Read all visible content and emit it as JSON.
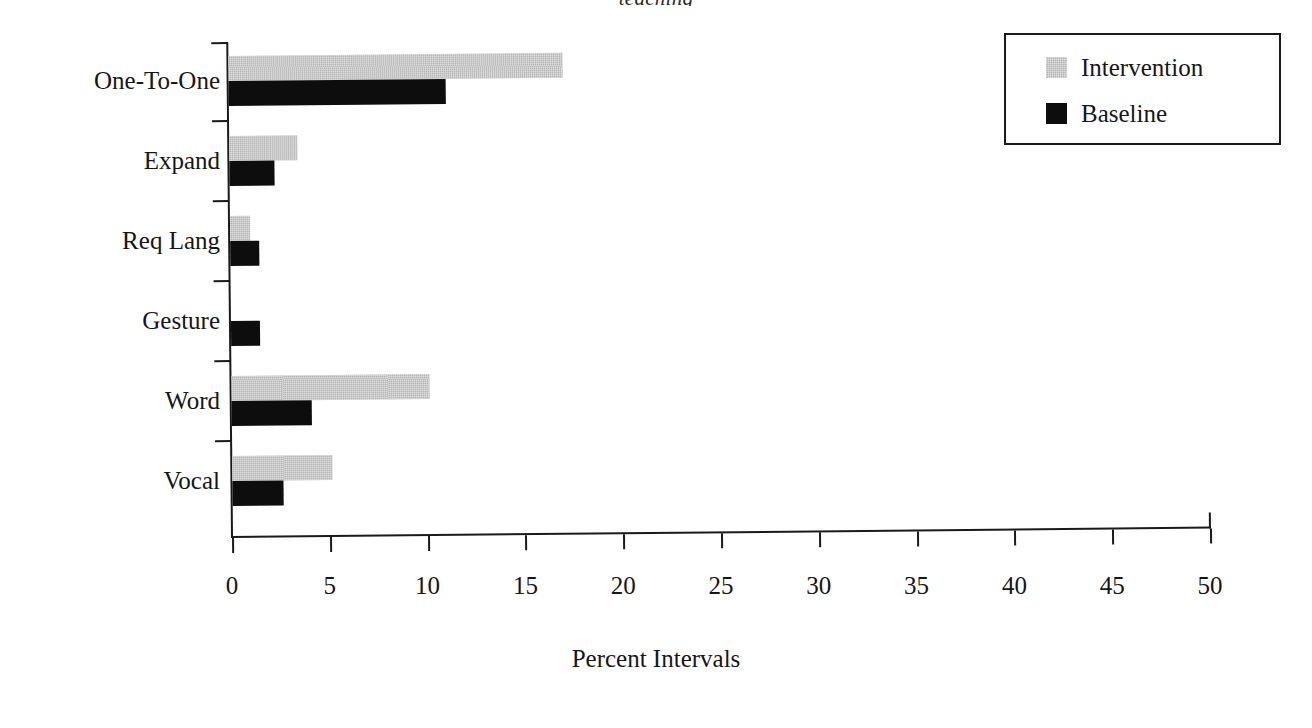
{
  "title_fragment": "teaching",
  "chart_data": {
    "type": "bar",
    "orientation": "horizontal",
    "title": "",
    "xlabel": "Percent Intervals",
    "ylabel": "",
    "xlim": [
      0,
      50
    ],
    "xticks": [
      0,
      5,
      10,
      15,
      20,
      25,
      30,
      35,
      40,
      45,
      50
    ],
    "xtick_labels": [
      "0",
      "5",
      "10",
      "15",
      "20",
      "25",
      "30",
      "35",
      "40",
      "45",
      "50"
    ],
    "grid": false,
    "legend_position": "top-right",
    "categories": [
      "One-To-One",
      "Expand",
      "Req Lang",
      "Gesture",
      "Word",
      "Vocal"
    ],
    "series": [
      {
        "name": "Intervention",
        "color": "#b6b6b6",
        "values": [
          17.1,
          3.5,
          1.0,
          0.0,
          10.1,
          5.1
        ]
      },
      {
        "name": "Baseline",
        "color": "#0d0d0d",
        "values": [
          11.1,
          2.3,
          1.5,
          1.5,
          4.1,
          2.6
        ]
      }
    ]
  },
  "legend": {
    "items": [
      {
        "label": "Intervention",
        "color": "#b6b6b6"
      },
      {
        "label": "Baseline",
        "color": "#0d0d0d"
      }
    ]
  }
}
